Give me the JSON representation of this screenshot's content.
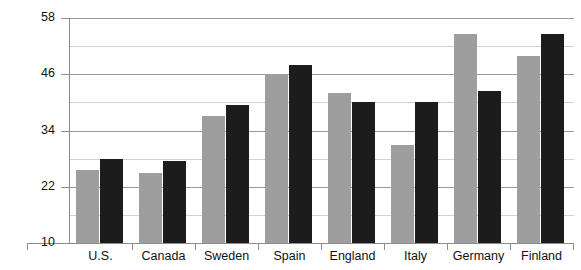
{
  "chart_data": {
    "type": "bar",
    "title": "",
    "xlabel": "",
    "ylabel": "",
    "ylim": [
      10,
      58
    ],
    "grid": true,
    "legend_position": "none",
    "y_major_ticks": [
      10,
      22,
      34,
      46,
      58
    ],
    "y_minor_ticks": [
      16,
      28,
      40,
      52
    ],
    "categories": [
      "U.S.",
      "Canada",
      "Sweden",
      "Spain",
      "England",
      "Italy",
      "Germany",
      "Finland"
    ],
    "series": [
      {
        "name": "series-a",
        "color": "#9e9e9e",
        "values": [
          25.6,
          25.0,
          37.0,
          46.0,
          42.0,
          31.0,
          54.5,
          50.0
        ]
      },
      {
        "name": "series-b",
        "color": "#1c1c1c",
        "values": [
          28.0,
          27.5,
          39.5,
          48.0,
          40.0,
          40.0,
          42.5,
          54.5
        ]
      }
    ]
  },
  "axis": {
    "y_tick_labels": [
      "58",
      "46",
      "34",
      "22",
      "10"
    ],
    "x_tick_labels": [
      "U.S.",
      "Canada",
      "Sweden",
      "Spain",
      "England",
      "Italy",
      "Germany",
      "Finland"
    ]
  },
  "colors": {
    "series_a": "#9e9e9e",
    "series_b": "#1c1c1c",
    "gridline_major": "#9a9a9a",
    "gridline_minor": "#d2d2d2",
    "axis": "#8c8c8c",
    "background": "#ffffff",
    "text": "#111111"
  }
}
